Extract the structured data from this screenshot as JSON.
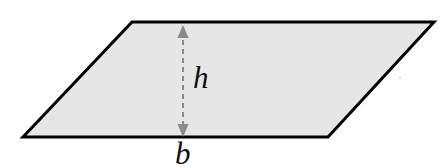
{
  "figure": {
    "kind": "geometry-diagram",
    "background_color": "#ffffff",
    "shape": {
      "name": "parallelogram",
      "fill_color": "#e6e6e6",
      "stroke_color": "#000000",
      "stroke_width": 3,
      "vertices": [
        {
          "name": "top-left",
          "x": 132,
          "y": 22
        },
        {
          "name": "top-right",
          "x": 434,
          "y": 22
        },
        {
          "name": "bottom-right",
          "x": 328,
          "y": 137
        },
        {
          "name": "bottom-left",
          "x": 23,
          "y": 137
        }
      ],
      "points_path": "132,22 434,22 328,137 23,137"
    },
    "height_arrow": {
      "name": "height-measure-arrow",
      "color": "#8a8a8a",
      "style": "dashed-double-headed",
      "dash_pattern": "5,4",
      "stroke_width": 2,
      "x": 183,
      "y_top": 25,
      "y_bottom": 137,
      "arrowhead_width": 11,
      "arrowhead_height": 13
    },
    "labels": [
      {
        "id": "h",
        "name": "height-label",
        "text": "h",
        "style": "italic",
        "color": "#111111",
        "font_size": 31,
        "x": 193,
        "y": 62
      },
      {
        "id": "b",
        "name": "base-label",
        "text": "b",
        "style": "italic",
        "color": "#111111",
        "font_size": 31,
        "x": 175,
        "y": 138
      }
    ],
    "speck": {
      "name": "stray-speck",
      "x": 400,
      "y": 78,
      "color": "#cfcfcf",
      "radius": 1
    }
  }
}
